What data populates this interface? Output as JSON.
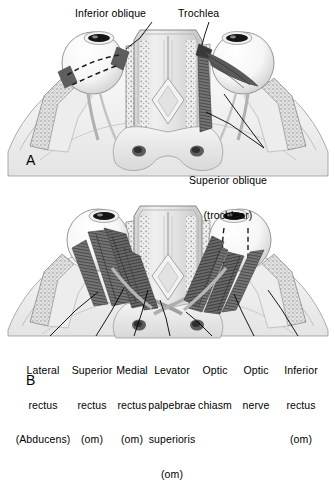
{
  "figure": {
    "title_hidden": "",
    "type": "anatomical-illustration",
    "view": "superior view of the orbits",
    "background_color": "#ffffff",
    "ink_color": "#000000",
    "palette": {
      "bone_light": "#e8e8e8",
      "bone_mid": "#cfcfcf",
      "bone_stipple": "#9a9a9a",
      "globe_white": "#fbfbfb",
      "globe_shadow": "#d9d9d9",
      "muscle_dark": "#4a4a4a",
      "muscle_mid": "#6f6f6f",
      "muscle_light": "#9c9c9c",
      "sinus_grey": "#c4c4c4",
      "outline": "#5a5a5a"
    }
  },
  "panels": [
    {
      "id": "A",
      "letter": "A",
      "x": 26,
      "y": 152,
      "caption": "Inferior oblique and superior oblique (trochlear) muscles"
    },
    {
      "id": "B",
      "letter": "B",
      "x": 26,
      "y": 372,
      "caption": "Rectus muscles, levator palpebrae superioris, optic chiasm and nerve"
    }
  ],
  "labels_top": [
    {
      "name": "inferior-oblique",
      "text": "Inferior oblique",
      "x": 75,
      "y": 8,
      "align": "left",
      "leader": [
        [
          152,
          22
        ],
        [
          140,
          38
        ],
        [
          126,
          49
        ]
      ]
    },
    {
      "name": "trochlea",
      "text": "Trochlea",
      "x": 178,
      "y": 8,
      "align": "left",
      "leader": [
        [
          209,
          22
        ],
        [
          205,
          34
        ],
        [
          202,
          45
        ]
      ]
    },
    {
      "name": "superior-oblique-trochlear",
      "text": "Superior oblique\n(trochlear)",
      "x": 228,
      "y": 152,
      "align": "center",
      "leader": [
        [
          264,
          148
        ],
        [
          243,
          120
        ],
        [
          224,
          94
        ]
      ]
    }
  ],
  "labels_bottom": [
    {
      "name": "lateral-rectus-abducens",
      "lines": [
        "Lateral",
        "rectus",
        "(Abducens)"
      ],
      "cx": 43,
      "y": 342,
      "leader": [
        [
          50,
          336
        ],
        [
          76,
          310
        ],
        [
          98,
          292
        ]
      ]
    },
    {
      "name": "superior-rectus-om",
      "lines": [
        "Superior",
        "rectus",
        "(om)"
      ],
      "cx": 92,
      "y": 342,
      "leader": [
        [
          96,
          336
        ],
        [
          112,
          310
        ],
        [
          124,
          288
        ]
      ]
    },
    {
      "name": "medial-rectus-om",
      "lines": [
        "Medial",
        "rectus",
        "(om)"
      ],
      "cx": 131,
      "y": 342,
      "leader": [
        [
          134,
          336
        ],
        [
          142,
          312
        ],
        [
          148,
          290
        ]
      ]
    },
    {
      "name": "levator-palpebrae-superioris-om",
      "lines": [
        "Levator",
        "palpebrae",
        "superioris",
        "(om)"
      ],
      "cx": 172,
      "y": 342,
      "leader": [
        [
          170,
          336
        ],
        [
          166,
          318
        ],
        [
          160,
          300
        ]
      ]
    },
    {
      "name": "optic-chiasm",
      "lines": [
        "Optic",
        "chiasm"
      ],
      "cx": 215,
      "y": 342,
      "leader": [
        [
          212,
          336
        ],
        [
          198,
          322
        ],
        [
          186,
          312
        ]
      ]
    },
    {
      "name": "optic-nerve",
      "lines": [
        "Optic",
        "nerve"
      ],
      "cx": 256,
      "y": 342,
      "leader": [
        [
          254,
          336
        ],
        [
          242,
          312
        ],
        [
          234,
          294
        ]
      ]
    },
    {
      "name": "inferior-rectus-om",
      "lines": [
        "Inferior",
        "rectus",
        "(om)"
      ],
      "cx": 301,
      "y": 342,
      "leader": [
        [
          298,
          336
        ],
        [
          282,
          310
        ],
        [
          268,
          290
        ]
      ]
    }
  ],
  "structures": {
    "globes": [
      {
        "name": "left-globe-panel-a",
        "cx": 93,
        "cy": 63,
        "r": 31
      },
      {
        "name": "right-globe-panel-a",
        "cx": 243,
        "cy": 63,
        "r": 31
      },
      {
        "name": "left-globe-panel-b",
        "cx": 98,
        "cy": 240,
        "r": 31
      },
      {
        "name": "right-globe-panel-b",
        "cx": 240,
        "cy": 240,
        "r": 31
      }
    ],
    "notes": [
      "Panel A: dashed lines on left globe indicate inferior oblique path beneath the eye",
      "Panel A: dark trochlea block and superior oblique tendon fan on right globe",
      "Panel B: striated rectus muscles converge at orbital apex",
      "Panel B: optic nerves meet at the optic chiasm at the midline"
    ]
  }
}
